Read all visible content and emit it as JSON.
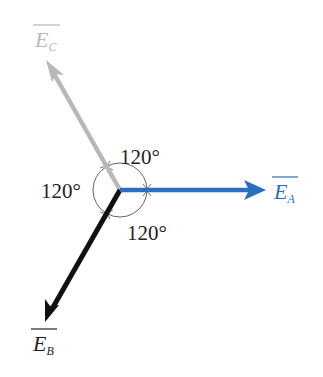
{
  "diagram": {
    "origin": {
      "x": 120,
      "y": 190
    },
    "vectors": [
      {
        "id": "EA",
        "symbol": "E",
        "subscript": "A",
        "overline": true,
        "color": "#2a6fc0",
        "tip": {
          "x": 265,
          "y": 190
        },
        "angle_deg": 0
      },
      {
        "id": "EC",
        "symbol": "E",
        "subscript": "C",
        "overline": true,
        "color": "#b8b8b8",
        "tip": {
          "x": 46,
          "y": 60
        },
        "angle_deg": 120
      },
      {
        "id": "EB",
        "symbol": "E",
        "subscript": "B",
        "overline": true,
        "color": "#111111",
        "tip": {
          "x": 45,
          "y": 322
        },
        "angle_deg": 240
      }
    ],
    "angles": [
      {
        "label": "120°",
        "position": "top"
      },
      {
        "label": "120°",
        "position": "left"
      },
      {
        "label": "120°",
        "position": "bottom"
      }
    ],
    "colors": {
      "phase_a": "#2a6fc0",
      "phase_b": "#111111",
      "phase_c": "#b8b8b8",
      "arc": "#666666",
      "text": "#222222"
    }
  }
}
